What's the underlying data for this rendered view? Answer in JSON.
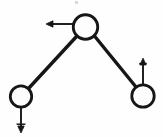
{
  "figure": {
    "background_color": "#fefefe",
    "stroke_color": "#161616",
    "node_fill_color": "#fdfdfd",
    "width": 163,
    "height": 137
  },
  "nodes": [
    {
      "id": "top-node",
      "label": "",
      "cx": 85.5,
      "cy": 27,
      "r": 13,
      "stroke_width": 2.6
    },
    {
      "id": "bottom-left-node",
      "label": "",
      "cx": 21,
      "cy": 96.5,
      "r": 11.5,
      "stroke_width": 2.6
    },
    {
      "id": "bottom-right-node",
      "label": "",
      "cx": 143,
      "cy": 96,
      "r": 12,
      "stroke_width": 2.6
    }
  ],
  "rods": [
    {
      "id": "left-rod",
      "from": "top-node",
      "to": "bottom-left-node",
      "x1": 76.5,
      "y1": 36.5,
      "x2": 28.5,
      "y2": 88.5,
      "stroke_width": 3.4
    },
    {
      "id": "right-rod",
      "from": "top-node",
      "to": "bottom-right-node",
      "x1": 94.5,
      "y1": 36,
      "x2": 136,
      "y2": 87,
      "stroke_width": 3.4
    }
  ],
  "arrows": [
    {
      "id": "top-node-arrow",
      "direction": "left",
      "attached_to": "top-node",
      "x1": 73,
      "y1": 24,
      "x2": 46,
      "y2": 24,
      "stroke_width": 1.9,
      "head_length": 7,
      "head_half_width": 3.2
    },
    {
      "id": "bottom-left-node-arrow",
      "direction": "down",
      "attached_to": "bottom-left-node",
      "x1": 21,
      "y1": 107,
      "x2": 21,
      "y2": 133,
      "stroke_width": 1.9,
      "head_length": 7,
      "head_half_width": 3.2
    },
    {
      "id": "bottom-right-node-arrow",
      "direction": "up",
      "attached_to": "bottom-right-node",
      "x1": 143,
      "y1": 84,
      "x2": 143,
      "y2": 58,
      "stroke_width": 1.9,
      "head_length": 7,
      "head_half_width": 3.2
    }
  ],
  "artifacts": [
    {
      "id": "speck-top",
      "x": 75,
      "y": 1,
      "w": 3,
      "h": 3
    }
  ]
}
